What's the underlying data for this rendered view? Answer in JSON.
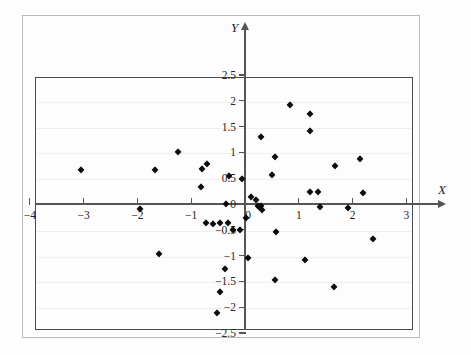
{
  "figure": {
    "axis_label_x": "X",
    "axis_label_y": "Y",
    "marker_color": "#0d0d0d",
    "axis_color": "#555555",
    "grid_color": "#f1eef0",
    "frame_color": "#b9b9b9",
    "plot_border_color": "#4a4a4a"
  },
  "chart_data": {
    "type": "scatter",
    "title": "",
    "xlabel": "X",
    "ylabel": "Y",
    "xlim": [
      -4,
      3
    ],
    "ylim": [
      -2.5,
      2.5
    ],
    "grid": true,
    "legend": "none",
    "xticks": [
      -4,
      -3,
      -2,
      -1,
      0,
      1,
      2,
      3
    ],
    "xtick_labels": [
      "−4",
      "−3",
      "−2",
      "−1",
      "0",
      "1",
      "2",
      "3"
    ],
    "yticks": [
      2.5,
      2,
      1.5,
      1,
      0.5,
      0,
      -0.5,
      -1,
      -1.5,
      -2,
      -2.5
    ],
    "ytick_labels": [
      "2.5",
      "2",
      "1.5",
      "1",
      "0.5",
      "0",
      "−0.5",
      "−1",
      "−1.5",
      "−2",
      "−2.5"
    ],
    "series": [
      {
        "name": "observations",
        "marker": "diamond",
        "color": "#0d0d0d",
        "points": [
          [
            -3.05,
            0.66
          ],
          [
            -1.95,
            -0.1
          ],
          [
            -1.68,
            0.66
          ],
          [
            -1.6,
            -0.97
          ],
          [
            -1.25,
            1.01
          ],
          [
            -0.82,
            0.33
          ],
          [
            -0.8,
            0.67
          ],
          [
            -0.7,
            0.77
          ],
          [
            -0.72,
            -0.36
          ],
          [
            -0.6,
            -0.38
          ],
          [
            -0.47,
            -0.36
          ],
          [
            -0.46,
            -1.7
          ],
          [
            -0.52,
            -2.12
          ],
          [
            -0.38,
            -1.25
          ],
          [
            -0.35,
            0.0
          ],
          [
            -0.31,
            -0.37
          ],
          [
            -0.3,
            0.55
          ],
          [
            -0.22,
            -0.5
          ],
          [
            -0.1,
            -0.5
          ],
          [
            -0.05,
            0.48
          ],
          [
            0.02,
            -0.28
          ],
          [
            0.05,
            -1.04
          ],
          [
            0.12,
            0.14
          ],
          [
            0.2,
            0.08
          ],
          [
            0.24,
            -0.03
          ],
          [
            0.26,
            -0.05
          ],
          [
            0.3,
            1.29
          ],
          [
            0.3,
            -0.04
          ],
          [
            0.32,
            -0.12
          ],
          [
            0.5,
            0.57
          ],
          [
            0.55,
            0.91
          ],
          [
            0.57,
            -0.55
          ],
          [
            0.56,
            -1.47
          ],
          [
            0.83,
            1.91
          ],
          [
            1.12,
            -1.08
          ],
          [
            1.2,
            1.75
          ],
          [
            1.2,
            1.42
          ],
          [
            1.2,
            0.23
          ],
          [
            1.36,
            0.23
          ],
          [
            1.4,
            -0.06
          ],
          [
            1.68,
            0.73
          ],
          [
            1.66,
            -1.61
          ],
          [
            1.92,
            -0.07
          ],
          [
            2.14,
            0.88
          ],
          [
            2.2,
            0.22
          ],
          [
            2.38,
            -0.67
          ]
        ]
      }
    ]
  }
}
